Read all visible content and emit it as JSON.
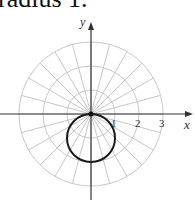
{
  "caption": "radius 1.",
  "diagram": {
    "type": "polar-graph",
    "axes": {
      "x_label": "x",
      "y_label": "y"
    },
    "radial_ticks": [
      "1",
      "2",
      "3"
    ],
    "grid": {
      "rings": 3,
      "spokes_deg_step": 15
    },
    "curve": {
      "description": "circle of radius 1 centered at (0,-1)",
      "equation": "r = -2 sin θ"
    },
    "colors": {
      "grid": "#c8c8c8",
      "curve": "#1a1a1a",
      "axes": "#333333"
    }
  }
}
